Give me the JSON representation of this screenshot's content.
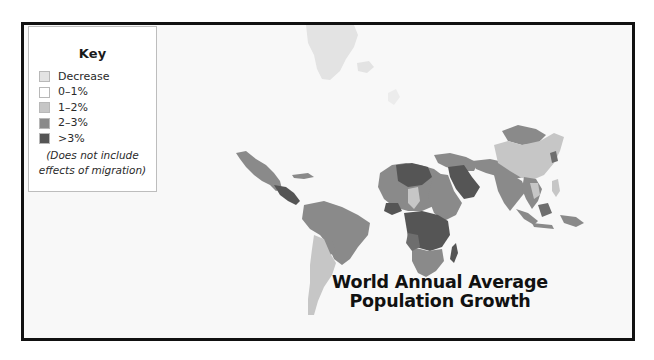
{
  "map": {
    "title_line1": "World Annual Average",
    "title_line2": "Population Growth",
    "background_color": "#f8f8f8",
    "frame_color": "#111111"
  },
  "legend": {
    "title": "Key",
    "items": [
      {
        "label": "Decrease",
        "color": "#e3e3e3"
      },
      {
        "label": "0–1%",
        "color": "#ffffff"
      },
      {
        "label": "1–2%",
        "color": "#c6c6c6"
      },
      {
        "label": "2–3%",
        "color": "#8a8a8a"
      },
      {
        "label": ">3%",
        "color": "#555555"
      }
    ],
    "note_line1": "(Does not include",
    "note_line2": "effects of migration)"
  },
  "regions": [
    {
      "name": "Greenland",
      "category": "Decrease"
    },
    {
      "name": "Iceland",
      "category": "Decrease"
    },
    {
      "name": "Mexico",
      "category": "2–3%"
    },
    {
      "name": "Central America",
      "category": ">3%"
    },
    {
      "name": "Caribbean",
      "category": "1–2%"
    },
    {
      "name": "Brazil / northern South America",
      "category": "2–3%"
    },
    {
      "name": "Argentina / Chile",
      "category": "1–2%"
    },
    {
      "name": "North Africa",
      "category": "2–3%"
    },
    {
      "name": "Libya / Algeria",
      "category": ">3%"
    },
    {
      "name": "Egypt region",
      "category": "1–2%"
    },
    {
      "name": "Sahel / Sudan",
      "category": "2–3%"
    },
    {
      "name": "Central Africa",
      "category": ">3%"
    },
    {
      "name": "Southern Africa",
      "category": "2–3%"
    },
    {
      "name": "Madagascar",
      "category": ">3%"
    },
    {
      "name": "Arabian Peninsula",
      "category": ">3%"
    },
    {
      "name": "Middle East",
      "category": "2–3%"
    },
    {
      "name": "India / South Asia",
      "category": "2–3%"
    },
    {
      "name": "China",
      "category": "1–2%"
    },
    {
      "name": "Mongolia",
      "category": "2–3%"
    },
    {
      "name": "Southeast Asia",
      "category": "2–3%"
    },
    {
      "name": "Indonesia / Philippines",
      "category": "2–3%"
    }
  ]
}
